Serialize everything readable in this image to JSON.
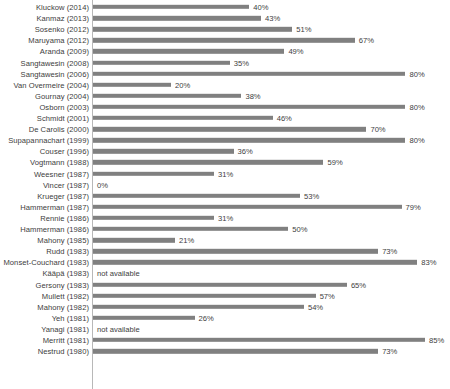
{
  "chart_data": {
    "type": "bar",
    "orientation": "horizontal",
    "title": "",
    "subtitle": "",
    "xlabel": "",
    "ylabel": "",
    "xlim": [
      0,
      85
    ],
    "grid": false,
    "legend": null,
    "bar_color": "#808080",
    "axis_color": "#b8b8b8",
    "text_color": "#3d3d3d",
    "value_suffix": "%",
    "missing_label": "not available",
    "categories": [
      "Kluckow (2014)",
      "Kanmaz (2013)",
      "Sosenko (2012)",
      "Maruyama (2012)",
      "Aranda (2009)",
      "Sangtawesin (2008)",
      "Sangtawesin (2006)",
      "Van Overmeire (2004)",
      "Gournay (2004)",
      "Osborn (2003)",
      "Schmidt (2001)",
      "De Carolis (2000)",
      "Supapannachart (1999)",
      "Couser (1996)",
      "Vogtmann (1988)",
      "Weesner (1987)",
      "Vincer (1987)",
      "Krueger (1987)",
      "Hammerman (1987)",
      "Rennie (1986)",
      "Hammerman (1986)",
      "Mahony (1985)",
      "Rudd (1983)",
      "Monset-Couchard (1983)",
      "Kääpä (1983)",
      "Gersony (1983)",
      "Mullett (1982)",
      "Mahony (1982)",
      "Yeh (1981)",
      "Yanagi (1981)",
      "Merritt (1981)",
      "Nestrud (1980)"
    ],
    "values": [
      40,
      43,
      51,
      67,
      49,
      35,
      80,
      20,
      38,
      80,
      46,
      70,
      80,
      36,
      59,
      31,
      0,
      53,
      79,
      31,
      50,
      21,
      73,
      83,
      null,
      65,
      57,
      54,
      26,
      null,
      85,
      73
    ],
    "value_labels": [
      "40%",
      "43%",
      "51%",
      "67%",
      "49%",
      "35%",
      "80%",
      "20%",
      "38%",
      "80%",
      "46%",
      "70%",
      "80%",
      "36%",
      "59%",
      "31%",
      "0%",
      "53%",
      "79%",
      "31%",
      "50%",
      "21%",
      "73%",
      "83%",
      "not available",
      "65%",
      "57%",
      "54%",
      "26%",
      "not available",
      "85%",
      "73%"
    ]
  }
}
